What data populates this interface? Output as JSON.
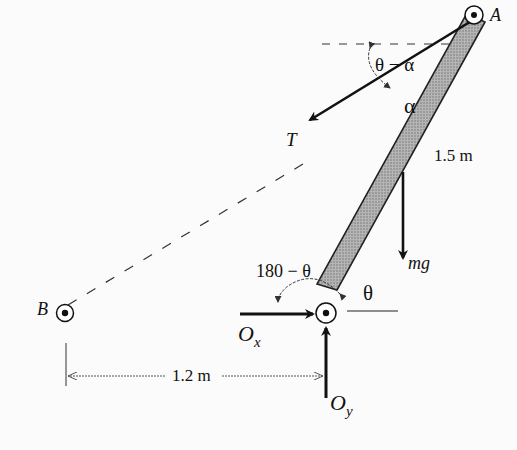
{
  "diagram": {
    "type": "free-body-diagram",
    "points": {
      "A": "A",
      "B": "B",
      "O": "O"
    },
    "labels": {
      "angle_theta_minus_alpha": "θ − α",
      "angle_alpha": "α",
      "tension": "T",
      "length": "1.5 m",
      "weight": "mg",
      "angle_180_minus_theta": "180 − θ",
      "angle_theta": "θ",
      "reaction_x_base": "O",
      "reaction_x_sub": "x",
      "reaction_y_base": "O",
      "reaction_y_sub": "y",
      "distance": "1.2 m"
    },
    "colors": {
      "ink": "#111111",
      "bar_fill": "#9a9a9a",
      "background": "#fbfbfb"
    }
  }
}
